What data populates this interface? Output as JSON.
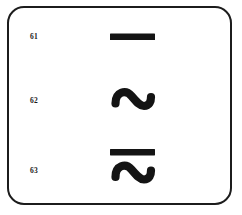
{
  "figure": {
    "type": "symbol-reference-table",
    "background_color": "#ffffff",
    "ink_color": "#141414",
    "frame": {
      "shape": "rounded-rectangle",
      "border_color": "#1c1c1c"
    }
  },
  "rows": [
    {
      "ref": "61",
      "symbol_name": "direct-current-symbol",
      "symbol_glyph": "solid-horizontal-bar"
    },
    {
      "ref": "62",
      "symbol_name": "alternating-current-symbol",
      "symbol_glyph": "tilde-sine-wave"
    },
    {
      "ref": "63",
      "symbol_name": "alternating-and-direct-current-symbol",
      "symbol_glyph": "bar-over-tilde"
    }
  ]
}
